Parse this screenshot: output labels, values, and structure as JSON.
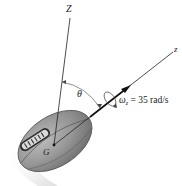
{
  "figure": {
    "labels": {
      "fixed_axis": "Z",
      "spin_axis": "z",
      "angle": "θ",
      "center_of_mass": "G",
      "omega_symbol": "ω",
      "omega_subscript": "z",
      "omega_value": " = 35 rad/s"
    },
    "colors": {
      "ball_fill": "#8f8f8f",
      "ball_highlight": "#b5b5b5",
      "ball_dark": "#6d6d6d",
      "lace_panel": "#d8d8d8",
      "lines": "#222222",
      "trail": "#e6e6e6"
    }
  }
}
